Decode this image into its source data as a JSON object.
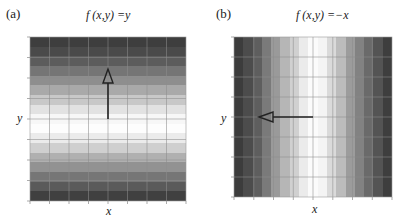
{
  "figure": {
    "panels": [
      {
        "id": "a",
        "label": "(a)",
        "title": "f (x,y) =y",
        "xlabel": "x",
        "ylabel": "y",
        "gradient_direction": "vertical",
        "arrow": "up",
        "bands": [
          "#3e3e3e",
          "#4a4a4a",
          "#5c5c5c",
          "#757575",
          "#8e8e8e",
          "#a9a9a9",
          "#c8c8c8",
          "#e2e2e2",
          "#f7f7f7",
          "#fdfdfd",
          "#ebebeb",
          "#cfcfcf",
          "#b0b0b0",
          "#929292",
          "#767676",
          "#5a5a5a",
          "#404040"
        ]
      },
      {
        "id": "b",
        "label": "(b)",
        "title": "f (x,y) =−x",
        "xlabel": "x",
        "ylabel": "y",
        "gradient_direction": "horizontal",
        "arrow": "left",
        "bands": [
          "#3c3c3c",
          "#4c4c4c",
          "#5e5e5e",
          "#7a7a7a",
          "#9a9a9a",
          "#b6b6b6",
          "#d0d0d0",
          "#ebebeb",
          "#fbfbfb",
          "#f4f4f4",
          "#dadada",
          "#bcbcbc",
          "#9c9c9c",
          "#828282",
          "#6a6a6a",
          "#545454",
          "#3e3e3e"
        ]
      }
    ],
    "grid": {
      "cols": 8,
      "rows": 8,
      "line_color": "#8c8c8c"
    },
    "arrow_color": "#222222"
  },
  "chart_data": [
    {
      "type": "heatmap",
      "title": "f (x,y) =y",
      "panel": "(a)",
      "xlabel": "x",
      "ylabel": "y",
      "description": "Grayscale field varying only along y; bright band at center, dark at top and bottom",
      "vector": "gradient arrow pointing +y (up)"
    },
    {
      "type": "heatmap",
      "title": "f (x,y) =−x",
      "panel": "(b)",
      "xlabel": "x",
      "ylabel": "y",
      "description": "Grayscale field varying only along x; bright band at center, dark at left and right",
      "vector": "gradient arrow pointing −x (left)"
    }
  ]
}
